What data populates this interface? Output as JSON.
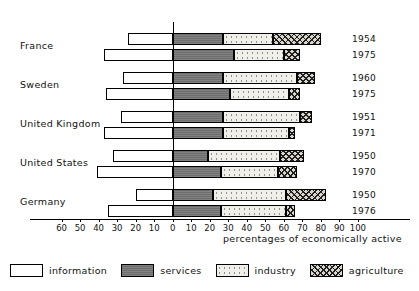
{
  "chart_data": {
    "type": "bar",
    "title": "",
    "subtitle": "",
    "xlabel": "percentages of economically active",
    "ylabel": "",
    "orientation": "horizontal",
    "stacked": true,
    "diverging": true,
    "zero_at": 0,
    "xlim": [
      -65,
      105
    ],
    "grid": false,
    "legend_position": "bottom",
    "axis_ticks": [
      60,
      50,
      40,
      30,
      20,
      10,
      0,
      10,
      20,
      30,
      40,
      50,
      60,
      70,
      80,
      90,
      100
    ],
    "axis_tick_values": [
      -60,
      -50,
      -40,
      -30,
      -20,
      -10,
      0,
      10,
      20,
      30,
      40,
      50,
      60,
      70,
      80,
      90,
      100
    ],
    "series": [
      {
        "name": "information",
        "fill": "white"
      },
      {
        "name": "services",
        "fill": "dark-gray"
      },
      {
        "name": "industry",
        "fill": "light-dotted"
      },
      {
        "name": "agriculture",
        "fill": "cross-hatch"
      }
    ],
    "categories": [
      "France",
      "Sweden",
      "United Kingdom",
      "United States",
      "Germany"
    ],
    "rows": [
      {
        "country": "France",
        "year": "1954",
        "information": 24,
        "services": 27,
        "industry": 27,
        "agriculture": 26
      },
      {
        "country": "France",
        "year": "1975",
        "information": 37,
        "services": 33,
        "industry": 27,
        "agriculture": 9
      },
      {
        "country": "Sweden",
        "year": "1960",
        "information": 27,
        "services": 27,
        "industry": 40,
        "agriculture": 10
      },
      {
        "country": "Sweden",
        "year": "1975",
        "information": 36,
        "services": 31,
        "industry": 32,
        "agriculture": 6
      },
      {
        "country": "United Kingdom",
        "year": "1951",
        "information": 28,
        "services": 27,
        "industry": 42,
        "agriculture": 6
      },
      {
        "country": "United Kingdom",
        "year": "1971",
        "information": 37,
        "services": 27,
        "industry": 36,
        "agriculture": 3
      },
      {
        "country": "United States",
        "year": "1950",
        "information": 32,
        "services": 19,
        "industry": 39,
        "agriculture": 13
      },
      {
        "country": "United States",
        "year": "1970",
        "information": 41,
        "services": 26,
        "industry": 31,
        "agriculture": 10
      },
      {
        "country": "Germany",
        "year": "1950",
        "information": 20,
        "services": 22,
        "industry": 39,
        "agriculture": 22
      },
      {
        "country": "Germany",
        "year": "1976",
        "information": 35,
        "services": 26,
        "industry": 35,
        "agriculture": 5
      }
    ]
  },
  "country_labels": [
    {
      "label": "France"
    },
    {
      "label": "Sweden"
    },
    {
      "label": "United Kingdom"
    },
    {
      "label": "United States"
    },
    {
      "label": "Germany"
    }
  ],
  "year_labels": [
    "1954",
    "1975",
    "1960",
    "1975",
    "1951",
    "1971",
    "1950",
    "1970",
    "1950",
    "1976"
  ],
  "axis": {
    "title": "percentages of economically active",
    "tick_labels": [
      "60",
      "50",
      "40",
      "30",
      "20",
      "10",
      "0",
      "10",
      "20",
      "30",
      "40",
      "50",
      "60",
      "70",
      "80",
      "90",
      "100"
    ]
  },
  "legend": {
    "items": [
      {
        "label": "information",
        "key": "information"
      },
      {
        "label": "services",
        "key": "services"
      },
      {
        "label": "industry",
        "key": "industry"
      },
      {
        "label": "agriculture",
        "key": "agriculture"
      }
    ]
  },
  "colors": {
    "information": "#ffffff",
    "services": "#6e6e6e",
    "industry": "#f0efe9",
    "agriculture": "#d8d6cf",
    "outline": "#000000"
  }
}
